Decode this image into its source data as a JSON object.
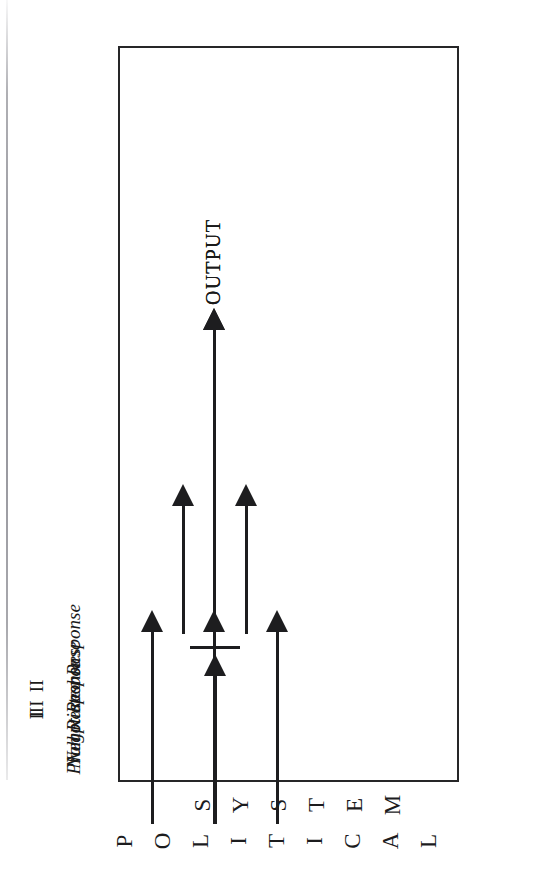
{
  "figure": {
    "title_letters_line1": [
      "P",
      "O",
      "L",
      "I",
      "T",
      "I",
      "C",
      "A",
      "L"
    ],
    "title_letters_line2": [
      "S",
      "Y",
      "S",
      "T",
      "E",
      "M"
    ],
    "title_line1": "POLITICAL",
    "title_line2": "SYSTEM",
    "box_label": "political-system-box",
    "ink_color": "#1d1d1f",
    "paper_color": "#ffffff"
  },
  "stages": [
    {
      "roman": "I",
      "caption": "Null Response",
      "kind": "blocked",
      "output": null,
      "inputs": 1
    },
    {
      "roman": "II",
      "caption": "Negotiated Response",
      "kind": "negotiated",
      "output": "OUTPUT",
      "inputs": 3,
      "intermediate": 2
    },
    {
      "roman": "III",
      "caption": "Prompt Response",
      "kind": "direct",
      "output": "OUTPUT",
      "inputs": 1
    }
  ],
  "outputs": {
    "negotiated_label": "OUTPUT",
    "prompt_label": "OUTPUT"
  }
}
